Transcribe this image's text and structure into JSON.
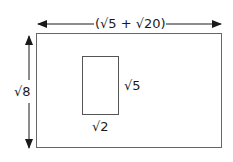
{
  "diagram": {
    "outer_rectangle": {
      "width_label": "(√5 + √20)",
      "height_label": "√8"
    },
    "inner_rectangle": {
      "width_label": "√2",
      "height_label": "√5"
    },
    "colors": {
      "stroke": "#555555",
      "text": "#1a1a1a",
      "background": "#ffffff"
    }
  }
}
